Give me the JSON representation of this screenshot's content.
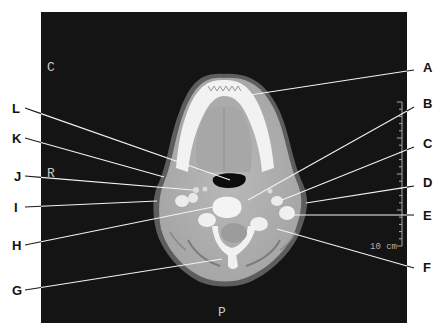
{
  "figure": {
    "panel": {
      "x": 41,
      "y": 12,
      "width": 366,
      "height": 311,
      "color": "#141414"
    },
    "orientation_markers": [
      {
        "id": "anterior",
        "text": "C",
        "x": 47,
        "y": 71
      },
      {
        "id": "right",
        "text": "R",
        "x": 47,
        "y": 177
      },
      {
        "id": "posterior",
        "text": "P",
        "x": 218,
        "y": 316
      }
    ],
    "scale_bar": {
      "label": "10 cm",
      "x": 402,
      "y_top": 102,
      "y_bottom": 246,
      "ticks": 20
    }
  },
  "callouts": [
    {
      "letter": "A",
      "lx": 423,
      "ly": 72,
      "x1": 414,
      "y1": 70,
      "x2": 250,
      "y2": 95
    },
    {
      "letter": "B",
      "lx": 423,
      "ly": 108,
      "x1": 414,
      "y1": 107,
      "x2": 248,
      "y2": 200
    },
    {
      "letter": "C",
      "lx": 423,
      "ly": 148,
      "x1": 414,
      "y1": 147,
      "x2": 282,
      "y2": 200
    },
    {
      "letter": "D",
      "lx": 423,
      "ly": 187,
      "x1": 414,
      "y1": 186,
      "x2": 306,
      "y2": 203
    },
    {
      "letter": "E",
      "lx": 423,
      "ly": 220,
      "x1": 414,
      "y1": 215,
      "x2": 290,
      "y2": 215
    },
    {
      "letter": "F",
      "lx": 423,
      "ly": 272,
      "x1": 414,
      "y1": 268,
      "x2": 277,
      "y2": 229
    },
    {
      "letter": "G",
      "lx": 12,
      "ly": 295,
      "x1": 25,
      "y1": 290,
      "x2": 222,
      "y2": 259
    },
    {
      "letter": "H",
      "lx": 12,
      "ly": 250,
      "x1": 25,
      "y1": 245,
      "x2": 213,
      "y2": 207
    },
    {
      "letter": "I",
      "lx": 14,
      "ly": 212,
      "x1": 25,
      "y1": 207,
      "x2": 157,
      "y2": 201
    },
    {
      "letter": "J",
      "lx": 14,
      "ly": 181,
      "x1": 25,
      "y1": 176,
      "x2": 193,
      "y2": 190
    },
    {
      "letter": "K",
      "lx": 12,
      "ly": 143,
      "x1": 25,
      "y1": 138,
      "x2": 164,
      "y2": 177
    },
    {
      "letter": "L",
      "lx": 12,
      "ly": 113,
      "x1": 25,
      "y1": 108,
      "x2": 230,
      "y2": 180
    }
  ]
}
